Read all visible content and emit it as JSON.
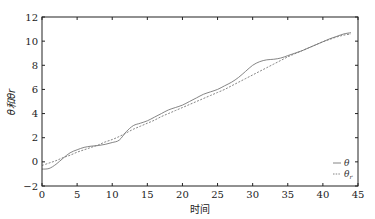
{
  "chart_data": {
    "type": "line",
    "title": "",
    "xlabel": "时间",
    "ylabel": "θ和θr",
    "xlim": [
      0,
      45
    ],
    "ylim": [
      -2,
      12
    ],
    "xticks": [
      0,
      5,
      10,
      15,
      20,
      25,
      30,
      35,
      40,
      45
    ],
    "yticks": [
      -2,
      0,
      2,
      4,
      6,
      8,
      10,
      12
    ],
    "grid": false,
    "legend_position": "lower right",
    "series": [
      {
        "name": "θ",
        "style": "solid",
        "x": [
          0,
          1,
          2,
          3,
          4,
          5,
          6,
          7,
          8,
          9,
          10,
          11,
          12,
          13,
          14,
          15,
          16,
          17,
          18,
          19,
          20,
          21,
          22,
          23,
          24,
          25,
          26,
          27,
          28,
          29,
          30,
          31,
          32,
          33,
          34,
          35,
          36,
          37,
          38,
          39,
          40,
          41,
          42,
          43,
          44
        ],
        "values": [
          -0.6,
          -0.55,
          -0.2,
          0.3,
          0.75,
          1.0,
          1.2,
          1.3,
          1.35,
          1.45,
          1.6,
          1.8,
          2.5,
          3.0,
          3.2,
          3.4,
          3.7,
          4.0,
          4.3,
          4.5,
          4.7,
          5.0,
          5.3,
          5.6,
          5.8,
          6.0,
          6.3,
          6.6,
          7.0,
          7.5,
          8.0,
          8.3,
          8.45,
          8.5,
          8.6,
          8.8,
          9.0,
          9.2,
          9.45,
          9.7,
          9.95,
          10.2,
          10.4,
          10.6,
          10.7
        ]
      },
      {
        "name": "θr",
        "style": "dashed",
        "x": [
          0,
          1,
          2,
          3,
          4,
          5,
          6,
          7,
          8,
          9,
          10,
          11,
          12,
          13,
          14,
          15,
          16,
          17,
          18,
          19,
          20,
          21,
          22,
          23,
          24,
          25,
          26,
          27,
          28,
          29,
          30,
          31,
          32,
          33,
          34,
          35,
          36,
          37,
          38,
          39,
          40,
          41,
          42,
          43,
          44
        ],
        "values": [
          -0.3,
          -0.1,
          0.1,
          0.35,
          0.55,
          0.8,
          1.0,
          1.2,
          1.4,
          1.65,
          1.85,
          2.1,
          2.4,
          2.7,
          2.95,
          3.2,
          3.45,
          3.75,
          4.0,
          4.25,
          4.5,
          4.75,
          5.0,
          5.25,
          5.5,
          5.75,
          6.0,
          6.3,
          6.6,
          6.9,
          7.2,
          7.5,
          7.8,
          8.1,
          8.4,
          8.7,
          8.95,
          9.2,
          9.45,
          9.7,
          9.95,
          10.15,
          10.35,
          10.5,
          10.6
        ]
      }
    ]
  },
  "legend": {
    "items": [
      {
        "label": "θ",
        "style": "solid"
      },
      {
        "label": "θr",
        "style": "dashed"
      }
    ]
  },
  "colors": {
    "theta": "#777777",
    "theta_r": "#777777",
    "axis": "#222222"
  }
}
